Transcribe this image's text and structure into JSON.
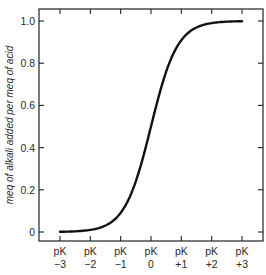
{
  "chart_data": {
    "type": "line",
    "title": "",
    "xlabel": "",
    "ylabel": "meq of alkali added per meq of acid",
    "x_ticks": [
      {
        "line1": "pK",
        "line2": "−3",
        "value": -3
      },
      {
        "line1": "pK",
        "line2": "−2",
        "value": -2
      },
      {
        "line1": "pK",
        "line2": "−1",
        "value": -1
      },
      {
        "line1": "pK",
        "line2": "0",
        "value": 0
      },
      {
        "line1": "pK",
        "line2": "+1",
        "value": 1
      },
      {
        "line1": "pK",
        "line2": "+2",
        "value": 2
      },
      {
        "line1": "pK",
        "line2": "+3",
        "value": 3
      }
    ],
    "y_ticks": [
      {
        "label": "0",
        "value": 0
      },
      {
        "label": "0.2",
        "value": 0.2
      },
      {
        "label": "0.4",
        "value": 0.4
      },
      {
        "label": "0.6",
        "value": 0.6
      },
      {
        "label": "0.8",
        "value": 0.8
      },
      {
        "label": "1.0",
        "value": 1.0
      }
    ],
    "xlim": [
      -3,
      3
    ],
    "ylim": [
      0,
      1.0
    ],
    "grid": false,
    "legend": null,
    "series": [
      {
        "name": "titration curve",
        "x": [
          -3,
          -2.5,
          -2,
          -1.5,
          -1,
          -0.75,
          -0.5,
          -0.25,
          0,
          0.25,
          0.5,
          0.75,
          1,
          1.5,
          2,
          2.5,
          3
        ],
        "y": [
          0.001,
          0.003,
          0.01,
          0.031,
          0.091,
          0.151,
          0.24,
          0.36,
          0.5,
          0.64,
          0.76,
          0.849,
          0.909,
          0.969,
          0.99,
          0.997,
          0.999
        ]
      }
    ],
    "colors": {
      "line": "#111111",
      "axis": "#222222",
      "text": "#2a2a2a"
    }
  }
}
